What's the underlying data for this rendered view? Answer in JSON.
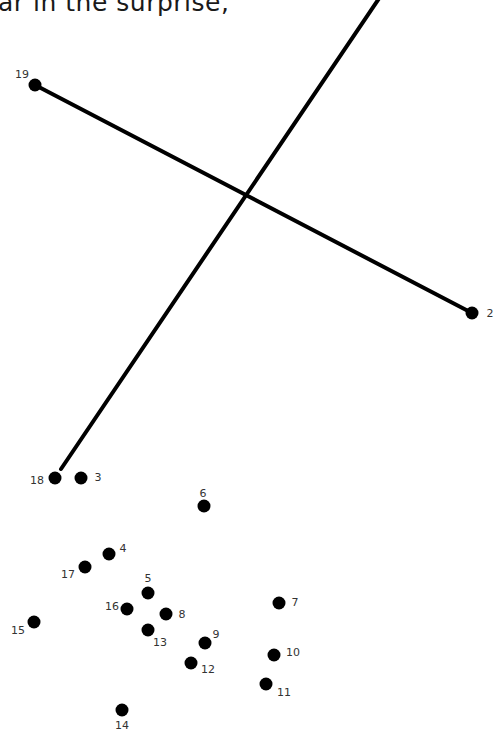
{
  "heading_text": "ar in the surprise,",
  "colors": {
    "dot": "#000000",
    "line": "#000000",
    "label": "#333333",
    "background": "#ffffff"
  },
  "lines": [
    {
      "from": [
        61,
        469
      ],
      "to": [
        380,
        -3
      ]
    },
    {
      "from": [
        35,
        85
      ],
      "to": [
        472,
        313
      ]
    }
  ],
  "dots": [
    {
      "n": "2",
      "x": 472,
      "y": 313,
      "lx": 490,
      "ly": 313
    },
    {
      "n": "3",
      "x": 81,
      "y": 478,
      "lx": 98,
      "ly": 477
    },
    {
      "n": "4",
      "x": 109,
      "y": 554,
      "lx": 123,
      "ly": 548
    },
    {
      "n": "5",
      "x": 148,
      "y": 593,
      "lx": 148,
      "ly": 578
    },
    {
      "n": "6",
      "x": 204,
      "y": 506,
      "lx": 203,
      "ly": 493
    },
    {
      "n": "7",
      "x": 279,
      "y": 603,
      "lx": 295,
      "ly": 602
    },
    {
      "n": "8",
      "x": 166,
      "y": 614,
      "lx": 182,
      "ly": 614
    },
    {
      "n": "9",
      "x": 205,
      "y": 643,
      "lx": 216,
      "ly": 634
    },
    {
      "n": "10",
      "x": 274,
      "y": 655,
      "lx": 293,
      "ly": 652
    },
    {
      "n": "11",
      "x": 266,
      "y": 684,
      "lx": 284,
      "ly": 692
    },
    {
      "n": "12",
      "x": 191,
      "y": 663,
      "lx": 208,
      "ly": 669
    },
    {
      "n": "13",
      "x": 148,
      "y": 630,
      "lx": 160,
      "ly": 642
    },
    {
      "n": "14",
      "x": 122,
      "y": 710,
      "lx": 122,
      "ly": 725
    },
    {
      "n": "15",
      "x": 34,
      "y": 622,
      "lx": 18,
      "ly": 630
    },
    {
      "n": "16",
      "x": 127,
      "y": 609,
      "lx": 112,
      "ly": 606
    },
    {
      "n": "17",
      "x": 85,
      "y": 567,
      "lx": 68,
      "ly": 574
    },
    {
      "n": "18",
      "x": 55,
      "y": 478,
      "lx": 37,
      "ly": 480
    },
    {
      "n": "19",
      "x": 35,
      "y": 85,
      "lx": 22,
      "ly": 74
    }
  ]
}
